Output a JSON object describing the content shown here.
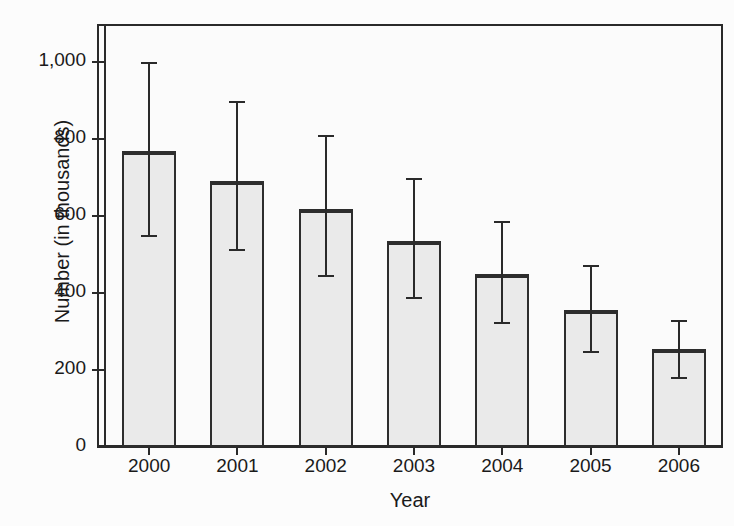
{
  "chart_data": {
    "type": "bar",
    "title": "",
    "xlabel": "Year",
    "ylabel": "Number (in thousands)",
    "categories": [
      "2000",
      "2001",
      "2002",
      "2003",
      "2004",
      "2005",
      "2006"
    ],
    "values": [
      768,
      690,
      618,
      535,
      450,
      355,
      255
    ],
    "error_high": [
      1000,
      898,
      810,
      698,
      588,
      473,
      330
    ],
    "error_low": [
      550,
      515,
      448,
      390,
      325,
      250,
      182
    ],
    "ylim": [
      0,
      1100
    ],
    "yticks": [
      0,
      200,
      400,
      600,
      800,
      1000
    ],
    "ytick_labels": [
      "0",
      "200",
      "400",
      "600",
      "800",
      "1,000"
    ],
    "grid": false,
    "legend": "none",
    "bar_fill_color": "#eaeaea",
    "bar_edge_color": "#2d2d2d",
    "axis_color": "#2a2a2a",
    "background_color": "#fbfbfb",
    "error_bar_style": "capped-vertical",
    "series": [
      {
        "name": "Number (in thousands)",
        "values": [
          768,
          690,
          618,
          535,
          450,
          355,
          255
        ]
      }
    ],
    "points": [
      {
        "category": "2000",
        "value": 768,
        "error_high": 1000,
        "error_low": 550
      },
      {
        "category": "2001",
        "value": 690,
        "error_high": 898,
        "error_low": 515
      },
      {
        "category": "2002",
        "value": 618,
        "error_high": 810,
        "error_low": 448
      },
      {
        "category": "2003",
        "value": 535,
        "error_high": 698,
        "error_low": 390
      },
      {
        "category": "2004",
        "value": 450,
        "error_high": 588,
        "error_low": 325
      },
      {
        "category": "2005",
        "value": 355,
        "error_high": 473,
        "error_low": 250
      },
      {
        "category": "2006",
        "value": 255,
        "error_high": 330,
        "error_low": 182
      }
    ]
  }
}
